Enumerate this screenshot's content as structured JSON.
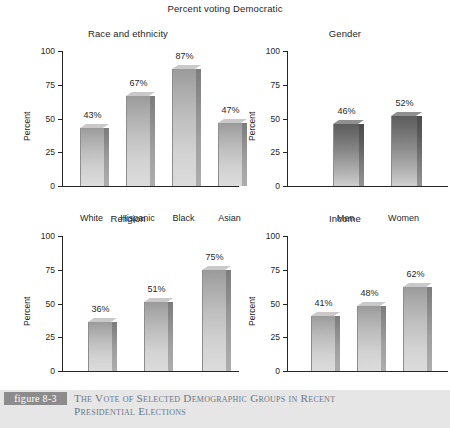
{
  "figure": {
    "main_title": "Percent voting Democratic",
    "tag": "figure 8-3",
    "caption_line1": "The Vote of Selected Demographic Groups in Recent",
    "caption_line2": "Presidential Elections",
    "band_color": "#e6e6e6",
    "tag_color": "#8c8c8c",
    "caption_color": "#6b7886"
  },
  "chart_data": [
    {
      "type": "bar",
      "title": "Race and ethnicity",
      "xlabel": "",
      "ylabel": "Percent",
      "ylim": [
        0,
        100
      ],
      "yticks": [
        0,
        25,
        50,
        75,
        100
      ],
      "ytick_labels": [
        "0",
        "25",
        "50",
        "75",
        "100"
      ],
      "grid": false,
      "legend": "none",
      "categories": [
        "White",
        "Hispanic",
        "Black",
        "Asian"
      ],
      "values": [
        43,
        67,
        87,
        47
      ],
      "data_labels": [
        "43%",
        "67%",
        "87%",
        "47%"
      ],
      "bar_style": "light"
    },
    {
      "type": "bar",
      "title": "Gender",
      "xlabel": "",
      "ylabel": "Percent",
      "ylim": [
        0,
        100
      ],
      "yticks": [
        0,
        25,
        50,
        75,
        100
      ],
      "ytick_labels": [
        "0",
        "25",
        "50",
        "75",
        "100"
      ],
      "grid": false,
      "legend": "none",
      "categories": [
        "Men",
        "Women"
      ],
      "values": [
        46,
        52
      ],
      "data_labels": [
        "46%",
        "52%"
      ],
      "bar_style": "dark"
    },
    {
      "type": "bar",
      "title": "Religion",
      "xlabel": "",
      "ylabel": "Percent",
      "ylim": [
        0,
        100
      ],
      "yticks": [
        0,
        25,
        50,
        75,
        100
      ],
      "ytick_labels": [
        "0",
        "25",
        "50",
        "75",
        "100"
      ],
      "grid": false,
      "legend": "none",
      "categories": [
        "Protestant\n(white)",
        "Catholic",
        "Jewish"
      ],
      "category_lines": [
        [
          "Protestant",
          "(white)"
        ],
        [
          "Catholic"
        ],
        [
          "Jewish"
        ]
      ],
      "values": [
        36,
        51,
        75
      ],
      "data_labels": [
        "36%",
        "51%",
        "75%"
      ],
      "bar_style": "light"
    },
    {
      "type": "bar",
      "title": "Income",
      "xlabel": "",
      "ylabel": "Percent",
      "ylim": [
        0,
        100
      ],
      "yticks": [
        0,
        25,
        50,
        75,
        100
      ],
      "ytick_labels": [
        "0",
        "25",
        "50",
        "75",
        "100"
      ],
      "grid": false,
      "legend": "none",
      "categories": [
        "Top third",
        "Middle third",
        "Bottom third"
      ],
      "category_lines": [
        [
          "Top",
          "third"
        ],
        [
          "Middle",
          "third"
        ],
        [
          "Bottom",
          "third"
        ]
      ],
      "values": [
        41,
        48,
        62
      ],
      "data_labels": [
        "41%",
        "48%",
        "62%"
      ],
      "bar_style": "light"
    }
  ]
}
